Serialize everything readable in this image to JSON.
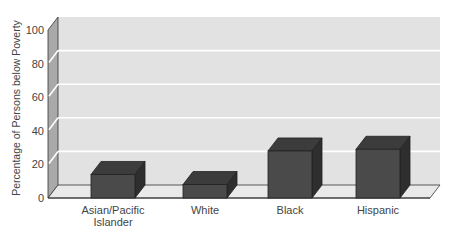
{
  "chart_data": {
    "type": "bar",
    "style": "3d",
    "title": "",
    "xlabel": "",
    "ylabel": "Percentage of Persons below Poverty",
    "categories": [
      "Asian/Pacific Islander",
      "White",
      "Black",
      "Hispanic"
    ],
    "category_lines": [
      [
        "Asian/Pacific",
        "Islander"
      ],
      [
        "White"
      ],
      [
        "Black"
      ],
      [
        "Hispanic"
      ]
    ],
    "values": [
      14,
      8,
      28,
      29
    ],
    "ylim": [
      0,
      100
    ],
    "yticks": [
      0,
      20,
      40,
      60,
      80,
      100
    ],
    "grid": true,
    "legend": null
  },
  "colors": {
    "bar_front": "#4a4a4a",
    "bar_top": "#3c3c3c",
    "bar_side": "#2e2e2e",
    "back_wall": "#e2e2e2",
    "side_wall": "#a9a9a9",
    "floor": "#e9e9e9",
    "grid": "#ffffff",
    "edge": "#333333"
  }
}
